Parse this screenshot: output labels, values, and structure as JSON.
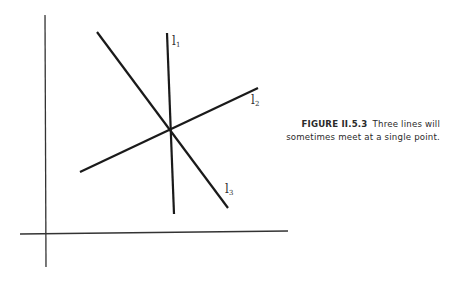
{
  "figure": {
    "caption_label": "FIGURE II.5.3",
    "caption_text_line1": "Three lines will",
    "caption_text_line2": "sometimes meet at a single point.",
    "lines": [
      {
        "name": "l",
        "subscript": "1"
      },
      {
        "name": "l",
        "subscript": "2"
      },
      {
        "name": "l",
        "subscript": "3"
      }
    ],
    "stroke_color": "#1a1a1a",
    "axis_color": "#333333"
  }
}
